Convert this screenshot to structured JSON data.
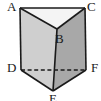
{
  "figure": {
    "kind": "geometry-diagram",
    "shape_name": "triangular-prism",
    "background_color": "#ffffff",
    "outline_color": "#1a1a1a",
    "faces": {
      "top_triangle": {
        "name": "top face ACB",
        "fill": "#f4f4f4"
      },
      "left_quad": {
        "name": "left face ABED",
        "fill": "#cfcfcf"
      },
      "right_quad": {
        "name": "right face BCFE",
        "fill": "#a8a8a8"
      }
    },
    "hidden_edge": {
      "name": "DF",
      "style": "dashed",
      "color": "#1a1a1a"
    }
  },
  "labels": {
    "A": "A",
    "B": "B",
    "C": "C",
    "D": "D",
    "E": "E",
    "F": "F"
  },
  "vertices": {
    "A": {
      "x": 20,
      "y": 8
    },
    "C": {
      "x": 85,
      "y": 8
    },
    "B": {
      "x": 57,
      "y": 29
    },
    "D": {
      "x": 21,
      "y": 70
    },
    "F": {
      "x": 86,
      "y": 70
    },
    "E": {
      "x": 53,
      "y": 91
    }
  },
  "edges": [
    {
      "name": "AC",
      "from": "A",
      "to": "C",
      "style": "solid"
    },
    {
      "name": "AB",
      "from": "A",
      "to": "B",
      "style": "solid"
    },
    {
      "name": "CB",
      "from": "C",
      "to": "B",
      "style": "solid"
    },
    {
      "name": "AD",
      "from": "A",
      "to": "D",
      "style": "solid"
    },
    {
      "name": "CF",
      "from": "C",
      "to": "F",
      "style": "solid"
    },
    {
      "name": "BE",
      "from": "B",
      "to": "E",
      "style": "solid"
    },
    {
      "name": "DE",
      "from": "D",
      "to": "E",
      "style": "solid"
    },
    {
      "name": "FE",
      "from": "F",
      "to": "E",
      "style": "solid"
    },
    {
      "name": "DF",
      "from": "D",
      "to": "F",
      "style": "dashed"
    }
  ]
}
